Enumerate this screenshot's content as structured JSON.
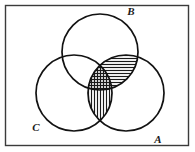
{
  "figure": {
    "background_color": "#ffffff",
    "border": {
      "name": "universal-set-rectangle",
      "x": 5.5,
      "y": 5.5,
      "width": 183,
      "height": 140,
      "stroke_color": "#3b3b3b",
      "stroke_width": 1.4,
      "fill": "none"
    },
    "stroke_color": "#121212",
    "stroke_width": 1.7,
    "hatch_color": "#1a1a1a"
  },
  "sets": [
    {
      "id": "B",
      "label": "B",
      "cx": 100,
      "cy": 52,
      "r": 38,
      "label_x": 131,
      "label_y": 15
    },
    {
      "id": "C",
      "label": "C",
      "cx": 74,
      "cy": 93,
      "r": 38,
      "label_x": 36,
      "label_y": 131
    },
    {
      "id": "A",
      "label": "A",
      "cx": 126,
      "cy": 93,
      "r": 38,
      "label_x": 158,
      "label_y": 143
    }
  ],
  "shaded_regions": [
    {
      "id": "A-and-B",
      "name": "intersection-a-b",
      "description": "Lens where circle A overlaps circle B",
      "hatch": "horizontal",
      "hatch_spacing": 3,
      "hatch_stroke_width": 1.15
    },
    {
      "id": "A-and-C",
      "name": "intersection-a-c",
      "description": "Lens where circle A overlaps circle C",
      "hatch": "vertical",
      "hatch_spacing": 3,
      "hatch_stroke_width": 1.15
    }
  ],
  "legend_notes": {
    "shaded_meaning": "(A ∩ B) ∪ (A ∩ C)",
    "unshaded_sets": [
      "B only",
      "C only",
      "A only",
      "B ∩ C only"
    ]
  }
}
